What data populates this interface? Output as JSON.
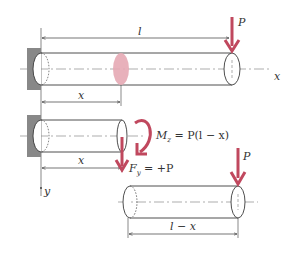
{
  "diagram": {
    "colors": {
      "line": "#3a3a3a",
      "centerline": "#8a8a8a",
      "wall": "#888888",
      "accent": "#c0485e",
      "section_fill": "#e6a9b4"
    },
    "top_beam": {
      "length_label": "l",
      "load_label": "P",
      "axis_label": "x",
      "section_dim_label": "x"
    },
    "cut_beam": {
      "dim_label": "x",
      "moment_label": "M",
      "moment_sub": "z",
      "moment_rhs": " = P(l − x)",
      "shear_label": "F",
      "shear_sub": "y",
      "shear_rhs": " = +P",
      "axis_label": "y"
    },
    "free_beam": {
      "load_label": "P",
      "dim_label": "l − x"
    }
  }
}
